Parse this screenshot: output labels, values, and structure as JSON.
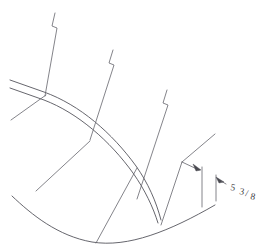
{
  "drawing": {
    "type": "engineering-line-drawing",
    "background_color": "#ffffff",
    "line_color": "#5a5a60",
    "text_color": "#3c3c42",
    "canvas": {
      "width": 268,
      "height": 249
    },
    "annotations": [
      {
        "id": "dimension-5-3-8",
        "whole": "5",
        "numerator": "3",
        "separator": "/",
        "denominator": "8",
        "full_text": "5 3/8",
        "x": 228,
        "y": 190
      }
    ],
    "geometry": {
      "upper_curve_outer": "M 10,80 L 44,92 C 80,105 112,133 136,166 C 148,183 156,201 161,219",
      "upper_curve_inner": "M 10,88 L 44,100 C 78,113 110,140 133,172 C 145,189 153,206 158,222",
      "lower_curve": "M 12,196 C 34,216 60,236 92,242 C 126,248 168,232 214,205",
      "left_diagonal": "M 12,120 L 44,96",
      "station_lines": [
        {
          "id": "station-1",
          "path": "M 55,13 L 52,27 L 57,29 L 45,96"
        },
        {
          "id": "station-2",
          "path": "M 113,50 L 109,64 L 114,66 L 89,140"
        },
        {
          "id": "station-3",
          "path": "M 168,90 L 164,104 L 169,106 L 136,200"
        },
        {
          "id": "station-4",
          "path": "M 215,134 L 182,162"
        }
      ],
      "radial_lines": [
        {
          "id": "radial-1",
          "path": "M 36,191 L 90,141"
        },
        {
          "id": "radial-2",
          "path": "M 96,243 L 136,168"
        },
        {
          "id": "radial-3",
          "path": "M 158,224 L 160,222"
        }
      ],
      "dimension": {
        "leader": "M 182,162 L 200,170",
        "extension_left": "M 202,168 L 202,207",
        "extension_right": "M 217,176 L 217,200",
        "arrow_1": {
          "x": 200,
          "y": 170,
          "angle": 205
        },
        "arrow_2": {
          "x": 216,
          "y": 178,
          "angle": 25
        },
        "witness_bottom": "M 202,207 L 217,200"
      }
    }
  }
}
